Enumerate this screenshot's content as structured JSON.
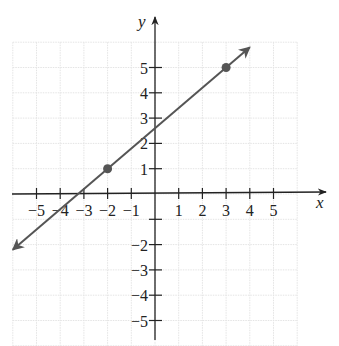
{
  "chart_data": {
    "type": "line",
    "title": "",
    "xlabel": "x",
    "ylabel": "y",
    "xlim": [
      -6,
      6
    ],
    "ylim": [
      -6,
      6
    ],
    "grid": true,
    "x_ticks": [
      -5,
      -4,
      -3,
      -2,
      -1,
      1,
      2,
      3,
      4,
      5
    ],
    "x_tick_labels": [
      "−5",
      "−4",
      "−3",
      "−2",
      "−1",
      "1",
      "2",
      "3",
      "4",
      "5"
    ],
    "y_ticks": [
      5,
      4,
      3,
      2,
      1,
      -1,
      -2,
      -3,
      -4,
      -5
    ],
    "y_tick_labels": [
      "5",
      "4",
      "3",
      "2",
      "1",
      "",
      "−2",
      "−3",
      "−4",
      "−5"
    ],
    "series": [
      {
        "name": "line through (-2,1) and (3,5)",
        "kind": "line-with-arrows",
        "slope": 0.8,
        "intercept": 2.6,
        "x_range": [
          -6.0,
          4.0
        ],
        "points": [
          {
            "x": -2,
            "y": 1
          },
          {
            "x": 3,
            "y": 5
          }
        ]
      }
    ],
    "colors": {
      "line": "#555555",
      "points": "#555555",
      "axes": "#222222",
      "grid": "#e4e4e4"
    }
  }
}
